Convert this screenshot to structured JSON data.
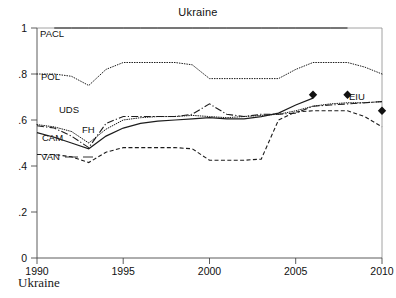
{
  "figure": {
    "title": "Ukraine",
    "caption": "Ukraine"
  },
  "axes": {
    "y_ticks": [
      "0",
      ".2",
      ".4",
      ".6",
      ".8",
      "1"
    ],
    "x_ticks": [
      "1990",
      "1995",
      "2000",
      "2005",
      "2010"
    ]
  },
  "series_labels": {
    "pacl": "PACL",
    "pol": "POL",
    "uds": "UDS",
    "fh": "FH",
    "cam": "CAM",
    "van": "VAN",
    "eiu": "EIU"
  },
  "chart_data": {
    "type": "line",
    "title": "Ukraine",
    "xlabel": "",
    "ylabel": "",
    "xlim": [
      1990,
      2010
    ],
    "ylim": [
      0,
      1
    ],
    "grid": false,
    "legend_position": "inline-labels",
    "x_tick_values": [
      1990,
      1995,
      2000,
      2005,
      2010
    ],
    "y_tick_values": [
      0,
      0.2,
      0.4,
      0.6,
      0.8,
      1.0
    ],
    "series": [
      {
        "name": "PACL",
        "style": "solid",
        "marker": "none",
        "x": [
          1991,
          1992,
          1993,
          1994,
          1995,
          1996,
          1997,
          1998,
          1999,
          2000,
          2001,
          2002,
          2003,
          2004,
          2005,
          2006,
          2007,
          2008
        ],
        "values": [
          1.0,
          1.0,
          1.0,
          1.0,
          1.0,
          1.0,
          1.0,
          1.0,
          1.0,
          1.0,
          1.0,
          1.0,
          1.0,
          1.0,
          1.0,
          1.0,
          1.0,
          1.0
        ]
      },
      {
        "name": "POL",
        "style": "dotted",
        "marker": "none",
        "x": [
          1990,
          1991,
          1992,
          1993,
          1994,
          1995,
          1996,
          1997,
          1998,
          1999,
          2000,
          2001,
          2002,
          2003,
          2004,
          2005,
          2006,
          2007,
          2008,
          2009,
          2010
        ],
        "values": [
          0.8,
          0.8,
          0.79,
          0.75,
          0.82,
          0.85,
          0.85,
          0.85,
          0.85,
          0.84,
          0.78,
          0.78,
          0.78,
          0.78,
          0.78,
          0.82,
          0.85,
          0.85,
          0.85,
          0.83,
          0.8
        ]
      },
      {
        "name": "UDS",
        "style": "dotted",
        "marker": "none",
        "x": [
          1990,
          1991,
          1992,
          1993,
          1994,
          1995,
          1996,
          1997,
          1998,
          1999,
          2000,
          2001,
          2002,
          2003,
          2004,
          2005,
          2006,
          2007,
          2008,
          2009,
          2010
        ],
        "values": [
          0.58,
          0.57,
          0.55,
          0.5,
          0.56,
          0.6,
          0.61,
          0.615,
          0.615,
          0.62,
          0.615,
          0.61,
          0.615,
          0.62,
          0.625,
          0.64,
          0.66,
          0.67,
          0.675,
          0.675,
          0.68
        ]
      },
      {
        "name": "FH",
        "style": "dash-dot",
        "marker": "none",
        "x": [
          1990,
          1991,
          1992,
          1993,
          1994,
          1995,
          1996,
          1997,
          1998,
          1999,
          2000,
          2001,
          2002,
          2003,
          2004,
          2005,
          2006,
          2007,
          2008,
          2009,
          2010
        ],
        "values": [
          0.575,
          0.565,
          0.53,
          0.48,
          0.585,
          0.615,
          0.615,
          0.615,
          0.615,
          0.625,
          0.67,
          0.625,
          0.615,
          0.625,
          0.625,
          0.63,
          0.66,
          0.665,
          0.67,
          0.675,
          0.68
        ]
      },
      {
        "name": "CAM",
        "style": "solid",
        "marker": "none",
        "x": [
          1990,
          1991,
          1992,
          1993,
          1994,
          1995,
          1996,
          1997,
          1998,
          1999,
          2000,
          2001,
          2002,
          2003,
          2004,
          2005,
          2006
        ],
        "values": [
          0.545,
          0.525,
          0.5,
          0.475,
          0.53,
          0.565,
          0.585,
          0.595,
          0.6,
          0.605,
          0.61,
          0.605,
          0.605,
          0.615,
          0.63,
          0.665,
          0.695
        ]
      },
      {
        "name": "VAN",
        "style": "dashed",
        "marker": "none",
        "x": [
          1990,
          1991,
          1992,
          1993,
          1994,
          1995,
          1996,
          1997,
          1998,
          1999,
          2000,
          2001,
          2002,
          2003,
          2004,
          2005,
          2006,
          2007,
          2008,
          2009,
          2010
        ],
        "values": [
          0.45,
          0.45,
          0.44,
          0.415,
          0.46,
          0.48,
          0.48,
          0.48,
          0.48,
          0.475,
          0.425,
          0.425,
          0.425,
          0.43,
          0.6,
          0.635,
          0.64,
          0.64,
          0.64,
          0.615,
          0.57
        ]
      },
      {
        "name": "EIU",
        "style": "markers",
        "marker": "diamond",
        "x": [
          2006,
          2008,
          2010
        ],
        "values": [
          0.71,
          0.71,
          0.64
        ]
      }
    ]
  }
}
